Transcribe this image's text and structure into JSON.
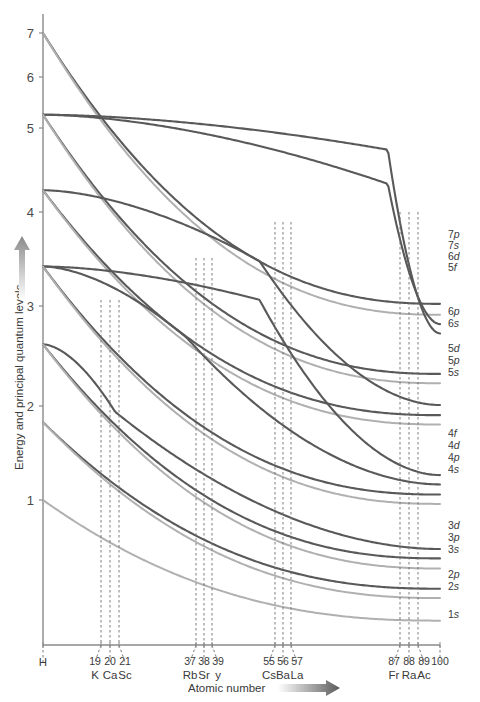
{
  "chart_data": {
    "type": "line",
    "title": "",
    "xlabel": "Atomic number",
    "ylabel": "Energy and principal quantum levels",
    "ylim": [
      0,
      7.6
    ],
    "xlim": [
      1,
      100
    ],
    "grid": false,
    "legend_position": "right-edge-inline",
    "y_ticks": [
      {
        "label": "7",
        "value": 7
      },
      {
        "label": "6",
        "value": 6
      },
      {
        "label": "5",
        "value": 5
      },
      {
        "label": "4",
        "value": 4
      },
      {
        "label": "3",
        "value": 3
      },
      {
        "label": "2",
        "value": 2
      },
      {
        "label": "1",
        "value": 1
      }
    ],
    "x_markers": [
      {
        "number": "",
        "symbol": "H",
        "z": 1
      },
      {
        "number": "19",
        "symbol": "K",
        "z": 19
      },
      {
        "number": "20",
        "symbol": "Ca",
        "z": 20
      },
      {
        "number": "21",
        "symbol": "Sc",
        "z": 21
      },
      {
        "number": "37",
        "symbol": "Rb",
        "z": 37
      },
      {
        "number": "38",
        "symbol": "Sr",
        "z": 38
      },
      {
        "number": "39",
        "symbol": "y",
        "z": 39
      },
      {
        "number": "55",
        "symbol": "Cs",
        "z": 55
      },
      {
        "number": "56",
        "symbol": "Ba",
        "z": 56
      },
      {
        "number": "57",
        "symbol": "La",
        "z": 57
      },
      {
        "number": "87",
        "symbol": "Fr",
        "z": 87
      },
      {
        "number": "88",
        "symbol": "Ra",
        "z": 88
      },
      {
        "number": "89",
        "symbol": "Ac",
        "z": 89
      },
      {
        "number": "100",
        "symbol": "",
        "z": 100
      }
    ],
    "colors": {
      "dark_curve": "#595959",
      "light_curve": "#b0b0b0",
      "axis": "#8a8a8a",
      "dash": "#6e6e6e",
      "text": "#3a3a3a"
    },
    "series": [
      {
        "name": "7p",
        "shade": "dark",
        "start_level": 7.0,
        "end_level": 3.52,
        "label": "7p"
      },
      {
        "name": "7s",
        "shade": "light",
        "start_level": 7.0,
        "end_level": 3.38,
        "label": "7s"
      },
      {
        "name": "6d",
        "shade": "dark",
        "start_level": 5.95,
        "end_level": 3.26,
        "label": "6d"
      },
      {
        "name": "5f",
        "shade": "dark",
        "start_level": 5.95,
        "end_level": 3.14,
        "label": "5f"
      },
      {
        "name": "6p",
        "shade": "dark",
        "start_level": 5.95,
        "end_level": 2.62,
        "label": "6p"
      },
      {
        "name": "6s",
        "shade": "light",
        "start_level": 5.95,
        "end_level": 2.5,
        "label": "6s"
      },
      {
        "name": "5d",
        "shade": "dark",
        "start_level": 4.98,
        "end_level": 2.22,
        "label": "5d"
      },
      {
        "name": "5p",
        "shade": "dark",
        "start_level": 4.98,
        "end_level": 2.09,
        "label": "5p"
      },
      {
        "name": "5s",
        "shade": "light",
        "start_level": 4.98,
        "end_level": 1.97,
        "label": "5s"
      },
      {
        "name": "4f",
        "shade": "dark",
        "start_level": 4.0,
        "end_level": 1.32,
        "label": "4f"
      },
      {
        "name": "4d",
        "shade": "dark",
        "start_level": 4.0,
        "end_level": 1.2,
        "label": "4d"
      },
      {
        "name": "4p",
        "shade": "dark",
        "start_level": 4.0,
        "end_level": 1.07,
        "label": "4p"
      },
      {
        "name": "4s",
        "shade": "light",
        "start_level": 4.0,
        "end_level": 0.95,
        "label": "4s"
      },
      {
        "name": "3d",
        "shade": "dark",
        "start_level": 3.0,
        "end_level": 0.37,
        "label": "3d"
      },
      {
        "name": "3p",
        "shade": "dark",
        "start_level": 3.0,
        "end_level": 0.25,
        "label": "3p"
      },
      {
        "name": "3s",
        "shade": "light",
        "start_level": 3.0,
        "end_level": 0.12,
        "label": "3s"
      },
      {
        "name": "2p",
        "shade": "dark",
        "start_level": 2.0,
        "end_level": -0.14,
        "label": "2p"
      },
      {
        "name": "2s",
        "shade": "light",
        "start_level": 2.0,
        "end_level": -0.26,
        "label": "2s"
      },
      {
        "name": "1s",
        "shade": "light",
        "start_level": 1.0,
        "end_level": -0.55,
        "label": "1s"
      }
    ]
  },
  "axis": {
    "x_title": "Atomic number",
    "y_title": "Energy and principal quantum levels"
  },
  "orbital_labels": [
    {
      "text": "7p",
      "y": 234
    },
    {
      "text": "7s",
      "y": 245
    },
    {
      "text": "6d",
      "y": 256
    },
    {
      "text": "5f",
      "y": 267
    },
    {
      "text": "6p",
      "y": 311
    },
    {
      "text": "6s",
      "y": 323
    },
    {
      "text": "5d",
      "y": 348
    },
    {
      "text": "5p",
      "y": 360
    },
    {
      "text": "5s",
      "y": 372
    },
    {
      "text": "4f",
      "y": 433
    },
    {
      "text": "4d",
      "y": 445
    },
    {
      "text": "4p",
      "y": 457
    },
    {
      "text": "4s",
      "y": 469
    },
    {
      "text": "3d",
      "y": 525
    },
    {
      "text": "3p",
      "y": 537
    },
    {
      "text": "3s",
      "y": 549
    },
    {
      "text": "2p",
      "y": 574
    },
    {
      "text": "2s",
      "y": 586
    },
    {
      "text": "1s",
      "y": 614
    }
  ],
  "y_tick_render": [
    {
      "text": "7",
      "y": 33
    },
    {
      "text": "6",
      "y": 77
    },
    {
      "text": "5",
      "y": 128
    },
    {
      "text": "4",
      "y": 212
    },
    {
      "text": "3",
      "y": 306
    },
    {
      "text": "2",
      "y": 406
    },
    {
      "text": "1",
      "y": 500
    }
  ],
  "x_tick_render": [
    {
      "num": "",
      "sym": "H",
      "x": 43,
      "group": 0
    },
    {
      "num": "19",
      "sym": "K",
      "x": 101,
      "group": 1
    },
    {
      "num": "20",
      "sym": "Ca",
      "x": 110,
      "group": 1
    },
    {
      "num": "21",
      "sym": "Sc",
      "x": 119,
      "group": 1
    },
    {
      "num": "37",
      "sym": "Rb",
      "x": 196,
      "group": 2
    },
    {
      "num": "38",
      "sym": "Sr",
      "x": 204,
      "group": 2
    },
    {
      "num": "39",
      "sym": "y",
      "x": 212,
      "group": 2
    },
    {
      "num": "55",
      "sym": "Cs",
      "x": 275,
      "group": 3
    },
    {
      "num": "56",
      "sym": "Ba",
      "x": 283,
      "group": 3
    },
    {
      "num": "57",
      "sym": "La",
      "x": 291,
      "group": 3
    },
    {
      "num": "87",
      "sym": "Fr",
      "x": 400,
      "group": 4
    },
    {
      "num": "88",
      "sym": "Ra",
      "x": 409,
      "group": 4
    },
    {
      "num": "89",
      "sym": "Ac",
      "x": 418,
      "group": 4
    },
    {
      "num": "100",
      "sym": "",
      "x": 440,
      "group": 5
    }
  ]
}
